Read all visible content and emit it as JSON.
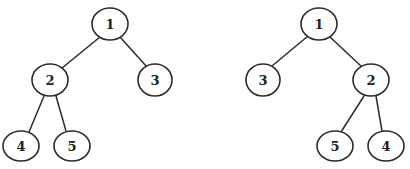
{
  "diagram": {
    "title": "",
    "colors": {
      "stroke": "#2a2a2a",
      "fill": "#ffffff",
      "text": "#222222"
    },
    "trees": [
      {
        "name": "left-tree",
        "nodes": [
          {
            "id": "L1",
            "label": "1",
            "x": 110,
            "y": 24
          },
          {
            "id": "L2",
            "label": "2",
            "x": 50,
            "y": 80
          },
          {
            "id": "L3",
            "label": "3",
            "x": 155,
            "y": 80
          },
          {
            "id": "L4",
            "label": "4",
            "x": 21,
            "y": 146
          },
          {
            "id": "L5",
            "label": "5",
            "x": 72,
            "y": 146
          }
        ],
        "edges": [
          [
            "L1",
            "L2"
          ],
          [
            "L1",
            "L3"
          ],
          [
            "L2",
            "L4"
          ],
          [
            "L2",
            "L5"
          ]
        ]
      },
      {
        "name": "right-tree",
        "nodes": [
          {
            "id": "R1",
            "label": "1",
            "x": 319,
            "y": 24
          },
          {
            "id": "R3",
            "label": "3",
            "x": 263,
            "y": 80
          },
          {
            "id": "R2",
            "label": "2",
            "x": 371,
            "y": 80
          },
          {
            "id": "R5",
            "label": "5",
            "x": 335,
            "y": 146
          },
          {
            "id": "R4",
            "label": "4",
            "x": 386,
            "y": 146
          }
        ],
        "edges": [
          [
            "R1",
            "R3"
          ],
          [
            "R1",
            "R2"
          ],
          [
            "R2",
            "R5"
          ],
          [
            "R2",
            "R4"
          ]
        ]
      }
    ]
  }
}
